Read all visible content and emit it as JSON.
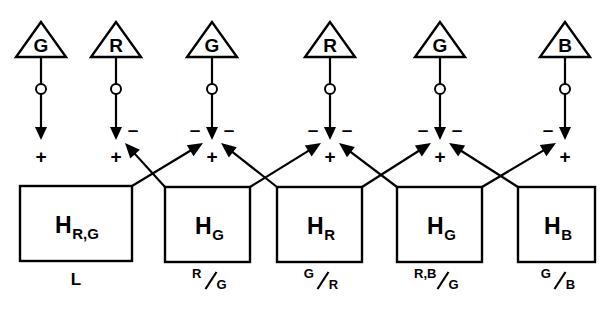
{
  "diagram": {
    "colors": {
      "ink": "#000000",
      "paper": "#ffffff"
    },
    "cones": [
      {
        "id": "cone-1",
        "label": "G",
        "cx": 41,
        "cy": 40
      },
      {
        "id": "cone-2",
        "label": "R",
        "cx": 116,
        "cy": 40
      },
      {
        "id": "cone-3",
        "label": "G",
        "cx": 212,
        "cy": 40
      },
      {
        "id": "cone-4",
        "label": "R",
        "cx": 330,
        "cy": 40
      },
      {
        "id": "cone-5",
        "label": "G",
        "cx": 440,
        "cy": 40
      },
      {
        "id": "cone-6",
        "label": "B",
        "cx": 565,
        "cy": 40
      }
    ],
    "horizontal_cells": [
      {
        "id": "hz-1",
        "main": "H",
        "sub": "R,G",
        "x": 20,
        "y": 186,
        "w": 112,
        "h": 75,
        "bottom_label": "L",
        "bottom_numerator": "",
        "bottom_denominator": ""
      },
      {
        "id": "hz-2",
        "main": "H",
        "sub": "G",
        "x": 165,
        "y": 187,
        "w": 85,
        "h": 75,
        "bottom_label": "",
        "bottom_numerator": "R",
        "bottom_denominator": "G"
      },
      {
        "id": "hz-3",
        "main": "H",
        "sub": "R",
        "x": 277,
        "y": 187,
        "w": 85,
        "h": 75,
        "bottom_label": "",
        "bottom_numerator": "G",
        "bottom_denominator": "R"
      },
      {
        "id": "hz-4",
        "main": "H",
        "sub": "G",
        "x": 397,
        "y": 187,
        "w": 85,
        "h": 75,
        "bottom_label": "",
        "bottom_numerator": "R,B",
        "bottom_denominator": "G"
      },
      {
        "id": "hz-5",
        "main": "H",
        "sub": "B",
        "x": 518,
        "y": 187,
        "w": 77,
        "h": 75,
        "bottom_label": "",
        "bottom_numerator": "G",
        "bottom_denominator": "B"
      }
    ],
    "terminals": [
      {
        "id": "terminal-1",
        "x": 41,
        "plus": "+",
        "minus_left": "",
        "minus_right": ""
      },
      {
        "id": "terminal-2",
        "x": 116,
        "plus": "+",
        "minus_left": "",
        "minus_right": "–"
      },
      {
        "id": "terminal-3",
        "x": 212,
        "plus": "+",
        "minus_left": "–",
        "minus_right": "–"
      },
      {
        "id": "terminal-4",
        "x": 330,
        "plus": "+",
        "minus_left": "–",
        "minus_right": "–"
      },
      {
        "id": "terminal-5",
        "x": 440,
        "plus": "+",
        "minus_left": "–",
        "minus_right": "–"
      },
      {
        "id": "terminal-6",
        "x": 565,
        "plus": "+",
        "minus_left": "–",
        "minus_right": ""
      }
    ],
    "signs": {
      "plus": "+",
      "minus": "–"
    },
    "geometry": {
      "triangle_half_width": 25,
      "triangle_height": 35,
      "triangle_top_y": 22,
      "triangle_base_y": 57,
      "synapse_circle_y": 89,
      "synapse_circle_r": 5,
      "arrow_tip_y": 140,
      "plus_y": 158,
      "minus_y": 131,
      "box_top_y": 187,
      "bottom_label_y": 285
    }
  }
}
